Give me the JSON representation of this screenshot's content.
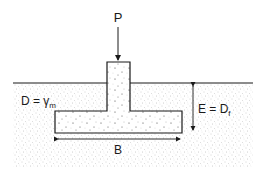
{
  "diagram": {
    "labels": {
      "load": "P",
      "soil_left_main": "D = γ",
      "soil_left_sub": "m",
      "depth_main": "E = D",
      "depth_sub": "f",
      "width": "B"
    },
    "colors": {
      "line": "#1a1a1a",
      "soil_speckle": "#9a9a9a",
      "concrete_speckle": "#333333",
      "background": "#ffffff"
    }
  }
}
